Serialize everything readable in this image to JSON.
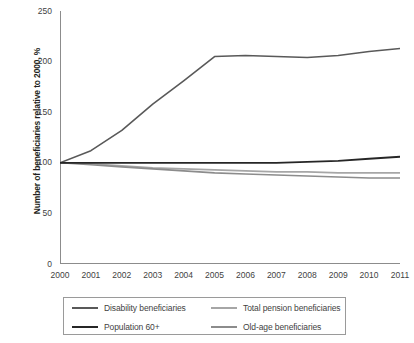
{
  "chart_data": {
    "type": "line",
    "title": "",
    "xlabel": "",
    "ylabel": "Number of beneficiaries relative to 2000, %",
    "x": [
      2000,
      2001,
      2002,
      2003,
      2004,
      2005,
      2006,
      2007,
      2008,
      2009,
      2010,
      2011
    ],
    "xticklabels": [
      "2000",
      "2001",
      "2002",
      "2003",
      "2004",
      "2005",
      "2006",
      "2007",
      "2008",
      "2009",
      "2010",
      "2011"
    ],
    "yticks": [
      0,
      50,
      100,
      150,
      200,
      250
    ],
    "yticklabels": [
      "0",
      "50",
      "100",
      "150",
      "200",
      "250"
    ],
    "ylim": [
      0,
      250
    ],
    "xlim": [
      2000,
      2011
    ],
    "grid": false,
    "legend_position": "below-plot",
    "series": [
      {
        "name": "Disability beneficiaries",
        "color": "#595959",
        "width": 1.6,
        "values": [
          100,
          112,
          132,
          158,
          181,
          205,
          206,
          205,
          204,
          206,
          210,
          213
        ]
      },
      {
        "name": "Total pension beneficiaries",
        "color": "#a6a6a6",
        "width": 1.6,
        "values": [
          100,
          99,
          97,
          95,
          94,
          93,
          92,
          91,
          91,
          90,
          90,
          90
        ]
      },
      {
        "name": "Population 60+",
        "color": "#262626",
        "width": 1.8,
        "values": [
          100,
          100,
          100,
          100,
          100,
          100,
          100,
          100,
          101,
          102,
          104,
          106
        ]
      },
      {
        "name": "Old-age beneficiaries",
        "color": "#8c8c8c",
        "width": 1.6,
        "values": [
          100,
          98,
          96,
          94,
          92,
          90,
          89,
          88,
          87,
          86,
          85,
          85
        ]
      }
    ]
  },
  "legend": {
    "items": [
      {
        "label": "Disability beneficiaries",
        "color": "#595959"
      },
      {
        "label": "Total pension beneficiaries",
        "color": "#a6a6a6"
      },
      {
        "label": "Population 60+",
        "color": "#262626"
      },
      {
        "label": "Old-age beneficiaries",
        "color": "#8c8c8c"
      }
    ]
  },
  "axes": {
    "axis_color": "#8c8c8c",
    "tick_color": "#3f3f3f"
  }
}
